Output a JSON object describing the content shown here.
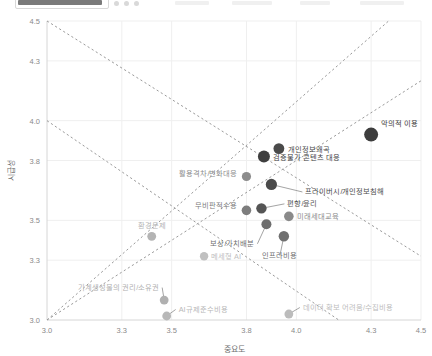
{
  "toolbar": {
    "present": true,
    "note": "partial cropped application toolbar strip"
  },
  "chart_data": {
    "type": "scatter",
    "title": "",
    "xlabel": "중요도",
    "ylabel": "시급성",
    "xlim": [
      3.0,
      4.5
    ],
    "ylim": [
      3.0,
      4.5
    ],
    "xticks": [
      "3.0",
      "3.3",
      "3.5",
      "3.8",
      "4.0",
      "4.3",
      "4.5"
    ],
    "xtick_values": [
      3.0,
      3.3,
      3.5,
      3.8,
      4.0,
      4.3,
      4.5
    ],
    "yticks": [
      "3.0",
      "3.3",
      "3.5",
      "3.8",
      "4.0",
      "4.3",
      "4.5"
    ],
    "ytick_values": [
      3.0,
      3.3,
      3.5,
      3.8,
      4.0,
      4.3,
      4.5
    ],
    "grid": true,
    "legend": "none",
    "reference_lines": [
      {
        "name": "ascending-diagonal",
        "from": [
          3.0,
          3.0
        ],
        "to": [
          4.5,
          4.2
        ],
        "style": "dashed"
      },
      {
        "name": "descending-diagonal",
        "from": [
          3.0,
          4.5
        ],
        "to": [
          4.5,
          3.32
        ],
        "style": "dashed"
      },
      {
        "name": "ascending-diagonal-lower",
        "from": [
          3.0,
          3.0
        ],
        "to": [
          4.37,
          4.5
        ],
        "style": "dashed"
      },
      {
        "name": "descending-diagonal-lower",
        "from": [
          3.0,
          4.0
        ],
        "to": [
          4.17,
          3.0
        ],
        "style": "dashed"
      }
    ],
    "points": [
      {
        "label": "악의적 이용",
        "x": 4.3,
        "y": 3.93,
        "color": "#3d3d3d",
        "size": 7.0,
        "label_dx": 10,
        "label_dy": -9,
        "anchor": "start",
        "leader": false
      },
      {
        "label": "개인정보왜곡",
        "x": 3.93,
        "y": 3.86,
        "color": "#4a4a4a",
        "size": 5.4,
        "label_dx": 9,
        "label_dy": 3,
        "anchor": "start",
        "leader": false
      },
      {
        "label": "검증불가 콘텐츠 대응",
        "x": 3.87,
        "y": 3.82,
        "color": "#3f3f3f",
        "size": 6.0,
        "label_dx": 9,
        "label_dy": 3,
        "anchor": "start",
        "leader": false
      },
      {
        "label": "활용격차/변화대응",
        "x": 3.8,
        "y": 3.72,
        "color": "#8c8c8c",
        "size": 4.6,
        "label_dx": -9,
        "label_dy": 0,
        "anchor": "end",
        "leader": false
      },
      {
        "label": "프라이버시/개인정보침해",
        "x": 3.9,
        "y": 3.68,
        "color": "#4a4a4a",
        "size": 5.6,
        "label_dx": 34,
        "label_dy": 10,
        "anchor": "start",
        "leader": true
      },
      {
        "label": "무비판적수용",
        "x": 3.8,
        "y": 3.55,
        "color": "#7d7d7d",
        "size": 4.8,
        "label_dx": -9,
        "label_dy": -2,
        "anchor": "end",
        "leader": false
      },
      {
        "label": "편향/윤리",
        "x": 3.86,
        "y": 3.56,
        "color": "#555555",
        "size": 5.2,
        "label_dx": 26,
        "label_dy": -2,
        "anchor": "start",
        "leader": true
      },
      {
        "label": "미래세대교육",
        "x": 3.97,
        "y": 3.52,
        "color": "#8a8a8a",
        "size": 4.8,
        "label_dx": 8,
        "label_dy": 3,
        "anchor": "start",
        "leader": false
      },
      {
        "label": "보상/가치배분",
        "x": 3.88,
        "y": 3.48,
        "color": "#6e6e6e",
        "size": 5.0,
        "label_dx": -12,
        "label_dy": 22,
        "anchor": "end",
        "leader": true
      },
      {
        "label": "인프라비용",
        "x": 3.95,
        "y": 3.42,
        "color": "#707070",
        "size": 5.2,
        "label_dx": -4,
        "label_dy": 22,
        "anchor": "middle",
        "leader": true
      },
      {
        "label": "환경문제",
        "x": 3.42,
        "y": 3.42,
        "color": "#b4b4b4",
        "size": 4.4,
        "label_dx": 0,
        "label_dy": -8,
        "anchor": "middle",
        "leader": false
      },
      {
        "label": "메세형 AI",
        "x": 3.63,
        "y": 3.32,
        "color": "#c0c0c0",
        "size": 4.2,
        "label_dx": 7,
        "label_dy": 3,
        "anchor": "start",
        "leader": false
      },
      {
        "label": "기계생성물의 권리/소유권",
        "x": 3.47,
        "y": 3.1,
        "color": "#b0b0b0",
        "size": 4.4,
        "label_dx": -5,
        "label_dy": -10,
        "anchor": "end",
        "leader": true
      },
      {
        "label": "AI규제준수비용",
        "x": 3.48,
        "y": 3.02,
        "color": "#b8b8b8",
        "size": 4.4,
        "label_dx": 12,
        "label_dy": -4,
        "anchor": "start",
        "leader": true
      },
      {
        "label": "데이터 확보 어려움/수집비용",
        "x": 3.97,
        "y": 3.03,
        "color": "#bcbcbc",
        "size": 4.4,
        "label_dx": 14,
        "label_dy": -4,
        "anchor": "start",
        "leader": true
      }
    ]
  },
  "colors": {
    "axis": "#d6d6d6",
    "grid": "#efefef",
    "reference_line": "#9a9a9a",
    "tick_text": "#8a8a8a",
    "axis_title": "#6f6f6f",
    "background": "#ffffff"
  }
}
